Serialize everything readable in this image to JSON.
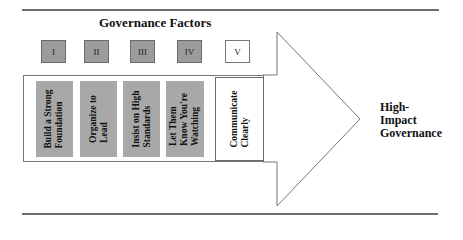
{
  "diagram": {
    "title": "Governance Factors",
    "factor_boxes": [
      {
        "label": "I",
        "filled": true
      },
      {
        "label": "II",
        "filled": true
      },
      {
        "label": "III",
        "filled": true
      },
      {
        "label": "IV",
        "filled": true
      },
      {
        "label": "V",
        "filled": false
      }
    ],
    "columns": [
      {
        "label": "Build a Strong\nFoundation",
        "filled": true
      },
      {
        "label": "Organize to\nLead",
        "filled": true
      },
      {
        "label": "Insist on High\nStandards",
        "filled": true
      },
      {
        "label": "Let Them\nKnow You're\nWatching",
        "filled": true
      },
      {
        "label": "Communicate\nClearly",
        "filled": false
      }
    ],
    "outcome": "High-\nImpact\nGovernance",
    "colors": {
      "filled_box": "#9c9c9c",
      "filled_column": "#a8a8a8",
      "outline": "#6a6a6a",
      "rule": "#6e6e6e"
    }
  }
}
